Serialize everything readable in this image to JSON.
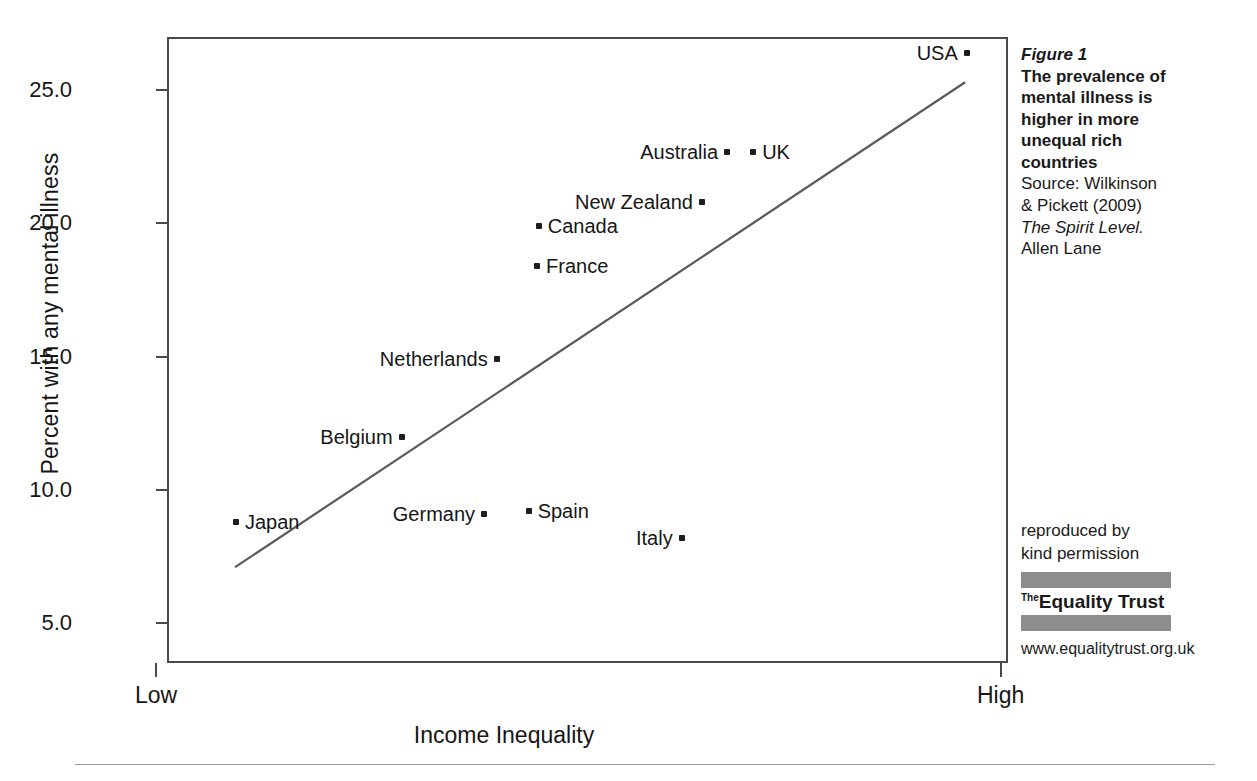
{
  "chart_data": {
    "type": "scatter",
    "title": "The prevalence of mental illness is higher in more unequal rich countries",
    "xlabel": "Income Inequality",
    "ylabel": "Percent with any mental illness",
    "ylim": [
      3.5,
      27.0
    ],
    "yticks": [
      "5.0",
      "10.0",
      "15.0",
      "20.0",
      "25.0"
    ],
    "ytick_values": [
      5.0,
      10.0,
      15.0,
      20.0,
      25.0
    ],
    "xticks": [
      "Low",
      "High"
    ],
    "grid": false,
    "legend": "none",
    "points": [
      {
        "label": "Japan",
        "x": 0.082,
        "y": 8.8,
        "label_side": "right"
      },
      {
        "label": "Germany",
        "x": 0.377,
        "y": 9.1,
        "label_side": "left"
      },
      {
        "label": "Spain",
        "x": 0.43,
        "y": 9.2,
        "label_side": "right"
      },
      {
        "label": "Italy",
        "x": 0.612,
        "y": 8.2,
        "label_side": "left"
      },
      {
        "label": "Belgium",
        "x": 0.279,
        "y": 12.0,
        "label_side": "left"
      },
      {
        "label": "Netherlands",
        "x": 0.392,
        "y": 14.9,
        "label_side": "left"
      },
      {
        "label": "France",
        "x": 0.44,
        "y": 18.4,
        "label_side": "right"
      },
      {
        "label": "Canada",
        "x": 0.442,
        "y": 19.9,
        "label_side": "right"
      },
      {
        "label": "New Zealand",
        "x": 0.636,
        "y": 20.8,
        "label_side": "left"
      },
      {
        "label": "Australia",
        "x": 0.666,
        "y": 22.7,
        "label_side": "left"
      },
      {
        "label": "UK",
        "x": 0.697,
        "y": 22.7,
        "label_side": "right"
      },
      {
        "label": "USA",
        "x": 0.951,
        "y": 26.4,
        "label_side": "left"
      }
    ],
    "trendline": {
      "x0": 0.081,
      "y0": 7.1,
      "x1": 0.949,
      "y1": 25.3
    }
  },
  "caption": {
    "figure_number": "Figure 1",
    "headline_lines": [
      "The prevalence of",
      "mental illness is",
      "higher in more",
      "unequal rich",
      "countries"
    ],
    "source_lines": [
      "Source: Wilkinson",
      "& Pickett (2009)"
    ],
    "source_title": "The Spirit Level.",
    "publisher": "Allen Lane"
  },
  "credit": {
    "line1": "reproduced by",
    "line2": "kind  permission",
    "logo_the": "The",
    "logo_name": "Equality Trust",
    "url": "www.equalitytrust.org.uk"
  },
  "colors": {
    "axis": "#4a4a4a",
    "point": "#1d1d1d",
    "trendline": "#5a5a5a",
    "logo_bar": "#8d8d8d",
    "rule": "#9a9a9a",
    "text": "#161616"
  }
}
